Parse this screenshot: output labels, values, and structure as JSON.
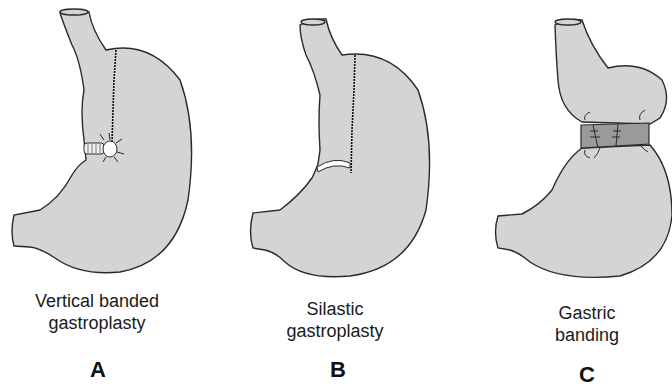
{
  "figure": {
    "panels": [
      {
        "letter": "A",
        "caption_line1": "Vertical banded",
        "caption_line2": "gastroplasty",
        "features": [
          "vertical-staple-line",
          "mesh-band-collar",
          "circular-window"
        ]
      },
      {
        "letter": "B",
        "caption_line1": "Silastic",
        "caption_line2": "gastroplasty",
        "features": [
          "vertical-staple-line",
          "silastic-ring"
        ]
      },
      {
        "letter": "C",
        "caption_line1": "Gastric",
        "caption_line2": "banding",
        "features": [
          "adjustable-band",
          "upper-pouch"
        ]
      }
    ],
    "colors": {
      "stomach_fill": "#d4d4d4",
      "outline": "#2a2a2a",
      "band_fill": "#9a9a9a",
      "ring_fill": "#ffffff",
      "background": "#ffffff"
    }
  }
}
